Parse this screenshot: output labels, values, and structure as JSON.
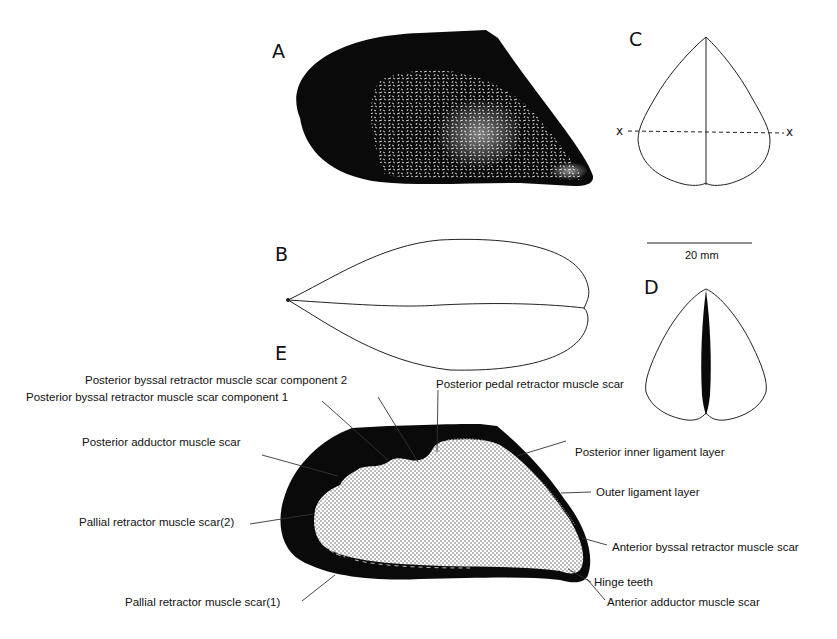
{
  "figure": {
    "panels": {
      "A": {
        "letter": "A",
        "description": "Lateral view of mussel shell (photograph)"
      },
      "B": {
        "letter": "B",
        "description": "Dorsal outline view"
      },
      "C": {
        "letter": "C",
        "description": "Anterior outline view with section line"
      },
      "D": {
        "letter": "D",
        "description": "Posterior outline view with ligament"
      },
      "E": {
        "letter": "E",
        "description": "Interior view of valve with muscle scars"
      }
    },
    "section_marker": {
      "left": "x",
      "right": "x"
    },
    "scale_bar": {
      "label": "20 mm"
    },
    "labels": {
      "pbr2": "Posterior byssal retractor muscle scar component 2",
      "pbr1": "Posterior byssal retractor muscle scar component 1",
      "ppr": "Posterior pedal retractor muscle scar",
      "pad": "Posterior adductor muscle scar",
      "pil": "Posterior inner ligament layer",
      "oll": "Outer ligament layer",
      "pr2": "Pallial retractor muscle scar(2)",
      "abr": "Anterior byssal retractor muscle scar",
      "ht": "Hinge teeth",
      "pr1": "Pallial retractor muscle scar(1)",
      "aad": "Anterior adductor muscle scar"
    },
    "colors": {
      "ink": "#111111",
      "paper": "#ffffff",
      "stipple": "#555555"
    }
  }
}
